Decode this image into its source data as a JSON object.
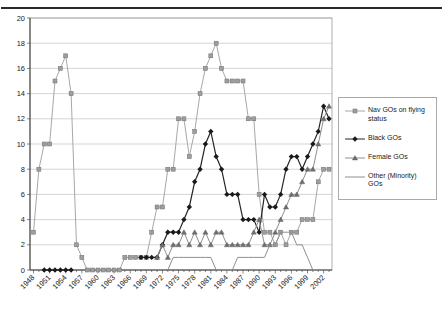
{
  "chart_data": {
    "type": "line",
    "title": "",
    "xlabel": "",
    "ylabel": "",
    "ylim": [
      0,
      20
    ],
    "ytick_step": 2,
    "y_tick_labels": [
      0,
      2,
      4,
      6,
      8,
      10,
      12,
      14,
      16,
      18,
      20
    ],
    "x_tick_labels": [
      "1948",
      "1951",
      "1954",
      "1957",
      "1960",
      "1963",
      "1966",
      "1969",
      "1972",
      "1975",
      "1978",
      "1981",
      "1984",
      "1987",
      "1990",
      "1993",
      "1996",
      "1999",
      "2002"
    ],
    "years": [
      1948,
      1949,
      1950,
      1951,
      1952,
      1953,
      1954,
      1955,
      1956,
      1957,
      1958,
      1959,
      1960,
      1961,
      1962,
      1963,
      1964,
      1965,
      1966,
      1967,
      1968,
      1969,
      1970,
      1971,
      1972,
      1973,
      1974,
      1975,
      1976,
      1977,
      1978,
      1979,
      1980,
      1981,
      1982,
      1983,
      1984,
      1985,
      1986,
      1987,
      1988,
      1989,
      1990,
      1991,
      1992,
      1993,
      1994,
      1995,
      1996,
      1997,
      1998,
      1999,
      2000,
      2001,
      2002,
      2003
    ],
    "legend_position": "right",
    "grid": true,
    "colors": {
      "gridline": "#c9c9c9",
      "plot_border": "#9b9b9b",
      "axis": "#3a3a3a",
      "text": "#1a1a1a"
    },
    "series": [
      {
        "name": "Nav GOs on flying status",
        "marker": "square",
        "color": "#a8a8a8",
        "marker_fill": "#9e9e9e",
        "marker_edge": "#6e6e6e",
        "values": [
          3,
          8,
          10,
          10,
          15,
          16,
          17,
          14,
          2,
          1,
          0,
          0,
          0,
          0,
          0,
          0,
          0,
          1,
          1,
          1,
          1,
          1,
          3,
          5,
          5,
          8,
          8,
          12,
          12,
          9,
          11,
          14,
          16,
          17,
          18,
          16,
          15,
          15,
          15,
          15,
          12,
          12,
          6,
          3,
          3,
          2,
          3,
          2,
          3,
          3,
          4,
          4,
          4,
          7,
          8,
          8
        ]
      },
      {
        "name": "Black GOs",
        "marker": "diamond",
        "color": "#262626",
        "marker_fill": "#1a1a1a",
        "marker_edge": "#1a1a1a",
        "values": [
          null,
          null,
          0,
          0,
          0,
          0,
          0,
          0,
          null,
          null,
          null,
          null,
          null,
          null,
          null,
          null,
          null,
          null,
          null,
          null,
          1,
          1,
          1,
          1,
          2,
          3,
          3,
          3,
          4,
          5,
          7,
          8,
          10,
          11,
          9,
          8,
          6,
          6,
          6,
          4,
          4,
          4,
          3,
          6,
          5,
          5,
          6,
          8,
          9,
          9,
          8,
          9,
          10,
          11,
          13,
          12
        ]
      },
      {
        "name": "Female GOs",
        "marker": "triangle",
        "color": "#8f8f8f",
        "marker_fill": "#6f6f6f",
        "marker_edge": "#585858",
        "values": [
          null,
          null,
          null,
          null,
          null,
          null,
          null,
          null,
          null,
          null,
          null,
          null,
          null,
          null,
          null,
          null,
          null,
          null,
          null,
          null,
          null,
          null,
          null,
          1,
          2,
          1,
          2,
          2,
          3,
          2,
          3,
          2,
          3,
          2,
          3,
          3,
          2,
          2,
          2,
          2,
          2,
          3,
          4,
          2,
          2,
          3,
          4,
          5,
          6,
          6,
          7,
          8,
          8,
          10,
          12,
          13
        ]
      },
      {
        "name": "Other (Minority) GOs",
        "marker": "none",
        "color": "#8f8f8f",
        "marker_fill": "#8f8f8f",
        "marker_edge": "#8f8f8f",
        "values": [
          null,
          null,
          null,
          null,
          null,
          null,
          null,
          null,
          null,
          null,
          null,
          null,
          null,
          null,
          null,
          null,
          null,
          null,
          null,
          null,
          null,
          null,
          null,
          null,
          null,
          0,
          1,
          1,
          1,
          1,
          1,
          1,
          1,
          1,
          0,
          0,
          0,
          0,
          1,
          1,
          1,
          1,
          1,
          1,
          2,
          2,
          3,
          3,
          3,
          2,
          2,
          1,
          0,
          0,
          0,
          0
        ]
      }
    ]
  }
}
